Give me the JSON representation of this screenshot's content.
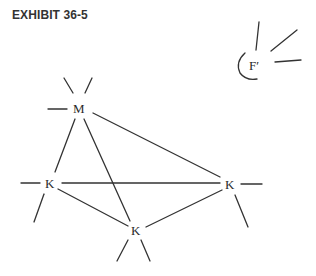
{
  "title": "EXHIBIT 36-5",
  "nodes": {
    "m": {
      "label": "M"
    },
    "k_left": {
      "label": "K"
    },
    "k_right": {
      "label": "K"
    },
    "k_bottom": {
      "label": "K"
    },
    "f_prime": {
      "label": "F′"
    }
  },
  "colors": {
    "line": "#333333",
    "text": "#2a2a2a",
    "background": "#ffffff"
  }
}
